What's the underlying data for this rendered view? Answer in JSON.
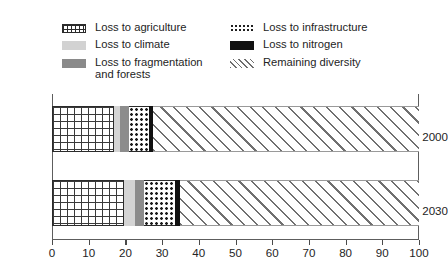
{
  "chart_data": {
    "type": "bar",
    "orientation": "horizontal",
    "stacked": true,
    "title": "",
    "xlabel": "",
    "ylabel": "",
    "categories": [
      "2000",
      "2030"
    ],
    "xlim": [
      0,
      100
    ],
    "xticks": [
      0,
      10,
      20,
      30,
      40,
      50,
      60,
      70,
      80,
      90,
      100
    ],
    "xtick_labels": [
      "0",
      "10",
      "20",
      "30",
      "40",
      "50",
      "60",
      "70",
      "80",
      "90",
      "100"
    ],
    "grid": false,
    "legend_position": "inside-top",
    "series": [
      {
        "name": "Loss to agriculture",
        "pattern": "grid-crosshatch",
        "values": [
          17.0,
          19.5
        ]
      },
      {
        "name": "Loss to climate",
        "pattern": "solid-light-gray",
        "values": [
          1.5,
          3.0
        ]
      },
      {
        "name": "Loss to fragmentation\nand forests",
        "pattern": "solid-medium-gray",
        "values": [
          2.5,
          2.5
        ]
      },
      {
        "name": "Loss to infrastructure",
        "pattern": "dotted",
        "values": [
          5.5,
          8.5
        ]
      },
      {
        "name": "Loss to nitrogen",
        "pattern": "solid-black",
        "values": [
          1.0,
          1.5
        ]
      },
      {
        "name": "Remaining diversity",
        "pattern": "diagonal-hatch",
        "values": [
          72.5,
          65.0
        ]
      }
    ]
  },
  "legend": {
    "items": [
      {
        "label": "Loss to agriculture",
        "swatch": "grid-icon"
      },
      {
        "label": "Loss to infrastructure",
        "swatch": "dots-icon"
      },
      {
        "label": "Loss to climate",
        "swatch": "light-gray-icon"
      },
      {
        "label": "Loss to nitrogen",
        "swatch": "black-icon"
      },
      {
        "label": "Loss to fragmentation\nand forests",
        "swatch": "dark-gray-icon"
      },
      {
        "label": "Remaining diversity",
        "swatch": "hatch-icon"
      }
    ]
  },
  "colors": {
    "agriculture": "#3a3a3a",
    "climate": "#d4d4d4",
    "fragmentation": "#8c8c8c",
    "infrastructure": "#1c1c1c",
    "nitrogen": "#111111",
    "remaining": "#707070",
    "frame": "#5d5d5d",
    "text": "#242424"
  }
}
